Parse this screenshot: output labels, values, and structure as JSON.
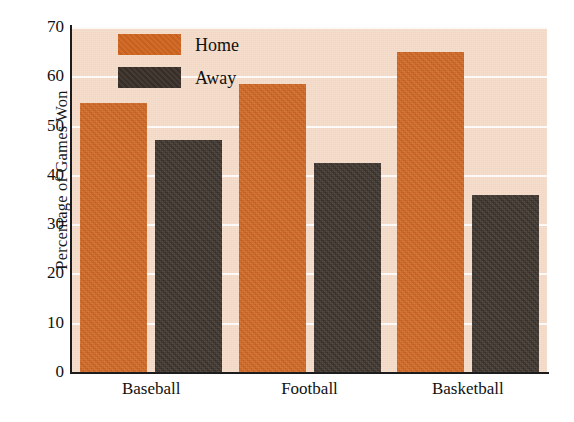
{
  "chart_data": {
    "type": "bar",
    "title": "",
    "xlabel": "",
    "ylabel": "Percentage of Games Won",
    "categories": [
      "Baseball",
      "Football",
      "Basketball"
    ],
    "series": [
      {
        "name": "Home",
        "color": "#cf6520",
        "values": [
          54.5,
          58.5,
          65
        ]
      },
      {
        "name": "Away",
        "color": "#3a3029",
        "values": [
          47,
          42.5,
          36
        ]
      }
    ],
    "ylim": [
      0,
      70
    ],
    "ytick_step": 10,
    "yticks": [
      0,
      10,
      20,
      30,
      40,
      50,
      60,
      70
    ],
    "grid": true,
    "grid_color": "#ffffff",
    "legend_position": "top-left-inside",
    "plot_background": "#f6dcc8",
    "figure_background": "#ffffff",
    "axis_color": "#1c1c1c"
  },
  "legend": {
    "entries": [
      {
        "label": "Home",
        "swatch": "#cf6520"
      },
      {
        "label": "Away",
        "swatch": "#3a3029"
      }
    ]
  }
}
